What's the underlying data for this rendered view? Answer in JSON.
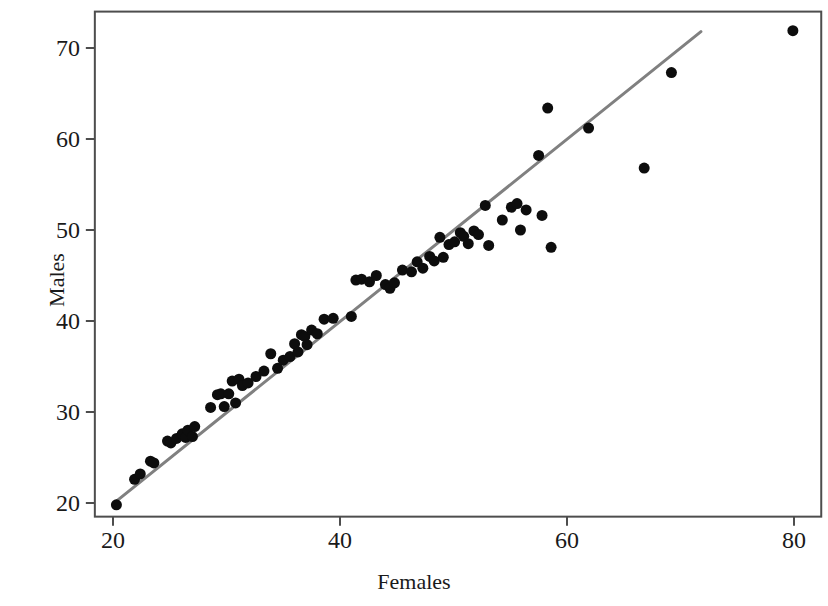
{
  "chart_data": {
    "type": "scatter",
    "title": "",
    "xlabel": "Females",
    "ylabel": "Males",
    "xlim": [
      18.4,
      82.4
    ],
    "ylim": [
      18.5,
      74.0
    ],
    "xticks": [
      20,
      40,
      60,
      80
    ],
    "yticks": [
      20,
      30,
      40,
      50,
      60,
      70
    ],
    "xtick_labels": [
      "20",
      "40",
      "60",
      "80"
    ],
    "ytick_labels": [
      "20",
      "30",
      "40",
      "50",
      "60",
      "70"
    ],
    "grid": false,
    "legend": null,
    "marker": {
      "shape": "circle",
      "color": "#0d0d0d",
      "size_px": 11
    },
    "frame_color": "#4d4d4d",
    "series": [
      {
        "name": "Life expectancy pairs",
        "points": [
          [
            20.3,
            19.8
          ],
          [
            21.9,
            22.6
          ],
          [
            22.4,
            23.2
          ],
          [
            23.3,
            24.6
          ],
          [
            23.6,
            24.4
          ],
          [
            24.8,
            26.8
          ],
          [
            25.1,
            26.6
          ],
          [
            25.6,
            27.1
          ],
          [
            26.1,
            27.6
          ],
          [
            26.4,
            27.2
          ],
          [
            26.6,
            28.0
          ],
          [
            27.0,
            27.3
          ],
          [
            27.2,
            28.4
          ],
          [
            28.6,
            30.5
          ],
          [
            29.2,
            31.9
          ],
          [
            29.5,
            32.0
          ],
          [
            29.8,
            30.6
          ],
          [
            30.2,
            32.0
          ],
          [
            30.5,
            33.4
          ],
          [
            30.8,
            31.0
          ],
          [
            31.1,
            33.6
          ],
          [
            31.4,
            32.9
          ],
          [
            31.9,
            33.2
          ],
          [
            32.6,
            33.9
          ],
          [
            33.3,
            34.5
          ],
          [
            33.9,
            36.4
          ],
          [
            34.5,
            34.8
          ],
          [
            35.0,
            35.7
          ],
          [
            35.6,
            36.1
          ],
          [
            36.0,
            37.5
          ],
          [
            36.3,
            36.6
          ],
          [
            36.6,
            38.5
          ],
          [
            36.9,
            38.3
          ],
          [
            37.1,
            37.4
          ],
          [
            37.5,
            39.0
          ],
          [
            38.0,
            38.6
          ],
          [
            38.6,
            40.2
          ],
          [
            39.4,
            40.3
          ],
          [
            41.0,
            40.5
          ],
          [
            41.4,
            44.5
          ],
          [
            41.9,
            44.6
          ],
          [
            42.6,
            44.3
          ],
          [
            43.2,
            45.0
          ],
          [
            44.0,
            44.0
          ],
          [
            44.4,
            43.6
          ],
          [
            44.8,
            44.2
          ],
          [
            45.5,
            45.6
          ],
          [
            46.3,
            45.4
          ],
          [
            46.8,
            46.5
          ],
          [
            47.3,
            45.8
          ],
          [
            47.9,
            47.1
          ],
          [
            48.3,
            46.6
          ],
          [
            48.8,
            49.2
          ],
          [
            49.1,
            47.0
          ],
          [
            49.6,
            48.4
          ],
          [
            50.1,
            48.7
          ],
          [
            50.6,
            49.7
          ],
          [
            50.9,
            49.3
          ],
          [
            51.3,
            48.5
          ],
          [
            51.8,
            49.9
          ],
          [
            52.2,
            49.5
          ],
          [
            52.8,
            52.7
          ],
          [
            53.1,
            48.3
          ],
          [
            54.3,
            51.1
          ],
          [
            55.1,
            52.5
          ],
          [
            55.6,
            52.9
          ],
          [
            55.9,
            50.0
          ],
          [
            56.4,
            52.2
          ],
          [
            57.5,
            58.2
          ],
          [
            57.8,
            51.6
          ],
          [
            58.3,
            63.4
          ],
          [
            58.6,
            48.1
          ],
          [
            61.9,
            61.2
          ],
          [
            66.8,
            56.8
          ],
          [
            69.2,
            67.3
          ],
          [
            79.9,
            71.9
          ]
        ]
      }
    ],
    "fit_line": {
      "name": "regression-line",
      "color": "#808080",
      "width_px": 3,
      "x_start": 20.0,
      "y_start": 19.9,
      "x_end": 71.8,
      "y_end": 71.8
    }
  },
  "axes": {
    "x_title": "Females",
    "y_title": "Males",
    "x_tick_0": "20",
    "x_tick_1": "40",
    "x_tick_2": "60",
    "x_tick_3": "80",
    "y_tick_0": "20",
    "y_tick_1": "30",
    "y_tick_2": "40",
    "y_tick_3": "50",
    "y_tick_4": "60",
    "y_tick_5": "70"
  }
}
